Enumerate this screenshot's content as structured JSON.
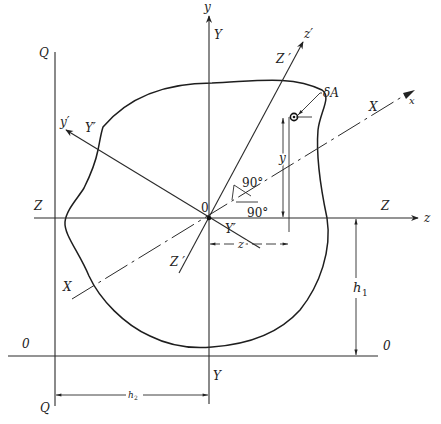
{
  "figure": {
    "origin_label": "0",
    "axes": {
      "y_axis": {
        "arrow_label": "y",
        "line_label_top": "Y",
        "line_label_bottom": "Y"
      },
      "z_axis": {
        "arrow_label": "z",
        "line_label_left": "Z",
        "line_label_right": "Z"
      },
      "z_prime_axis": {
        "arrow_label": "z′",
        "line_label_top": "Z ′",
        "line_label_bottom": "Z ′"
      },
      "y_prime_axis": {
        "arrow_label": "y′",
        "line_label_top": "Y′",
        "line_label_bottom": "Y′"
      },
      "x_axis": {
        "arrow_label": "x",
        "line_label_right": "X",
        "line_label_left": "X"
      }
    },
    "reference_lines": {
      "q_line": {
        "label_top": "Q",
        "label_bottom": "Q"
      },
      "zero_line": {
        "label_left": "0",
        "label_right": "0"
      }
    },
    "angles": [
      {
        "label": "90°",
        "position": "between z′ and y′ axes"
      },
      {
        "label": "90°",
        "position": "between y and z axes"
      }
    ],
    "element": {
      "label": "δA"
    },
    "dimensions": [
      {
        "label": "y",
        "meaning": "vertical distance of δA from z axis"
      },
      {
        "label": "z",
        "meaning": "horizontal distance of δA from y axis"
      },
      {
        "label": "h",
        "subscript": "1",
        "meaning": "distance from Z axis to 0 line"
      },
      {
        "label": "h",
        "subscript": "2",
        "meaning": "distance from Q line to Y axis"
      }
    ]
  }
}
